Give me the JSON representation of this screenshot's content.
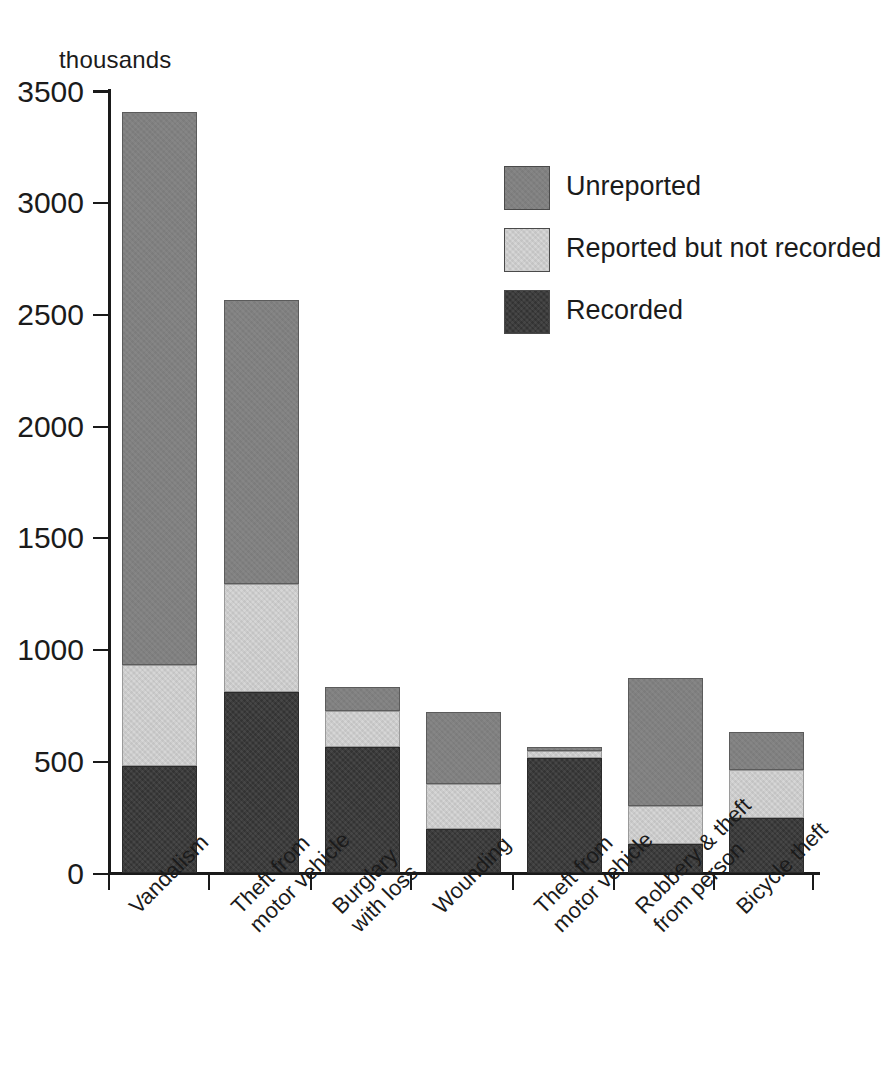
{
  "chart_data": {
    "type": "bar",
    "subtype": "stacked-bar",
    "title": "",
    "xlabel": "",
    "ylabel": "thousands",
    "unit_caption": "thousands",
    "ylim": [
      0,
      3500
    ],
    "yticks": [
      0,
      500,
      1000,
      1500,
      2000,
      2500,
      3000,
      3500
    ],
    "ytick_labels": [
      "0",
      "500",
      "1000",
      "1500",
      "2000",
      "2500",
      "3000",
      "3500"
    ],
    "grid": false,
    "legend_position": "upper right",
    "categories": [
      "Vandalism",
      "Theft from motor vehicle",
      "Burglary with loss",
      "Wounding",
      "Theft from motor vehicle",
      "Robbery & theft from person",
      "Bicycle theft"
    ],
    "category_label_lines": [
      [
        "Vandalism"
      ],
      [
        "Theft from",
        "motor vehicle"
      ],
      [
        "Burglary",
        "with loss"
      ],
      [
        "Wounding"
      ],
      [
        "Theft from",
        "motor vehicle"
      ],
      [
        "Robbery & theft",
        "from person"
      ],
      [
        "Bicycle theft"
      ]
    ],
    "series": [
      {
        "name": "Recorded",
        "color": "#333333",
        "values": [
          480,
          810,
          565,
          195,
          515,
          130,
          245
        ]
      },
      {
        "name": "Reported but not recorded",
        "color": "#d6d6d6",
        "values": [
          450,
          480,
          160,
          205,
          30,
          170,
          215
        ]
      },
      {
        "name": "Unreported",
        "color": "#808080",
        "values": [
          2470,
          1270,
          105,
          320,
          20,
          570,
          170
        ]
      }
    ],
    "stack_order_bottom_to_top": [
      "Recorded",
      "Reported but not recorded",
      "Unreported"
    ],
    "totals": [
      3400,
      2560,
      830,
      720,
      565,
      870,
      630
    ],
    "segment_tops": [
      {
        "category": "Vandalism",
        "recorded_top": 480,
        "reported_top": 930,
        "unreported_top": 3400
      },
      {
        "category": "Theft from motor vehicle",
        "recorded_top": 810,
        "reported_top": 1290,
        "unreported_top": 2560
      },
      {
        "category": "Burglary with loss",
        "recorded_top": 565,
        "reported_top": 725,
        "unreported_top": 830
      },
      {
        "category": "Wounding",
        "recorded_top": 195,
        "reported_top": 400,
        "unreported_top": 720
      },
      {
        "category": "Theft from motor vehicle",
        "recorded_top": 515,
        "reported_top": 545,
        "unreported_top": 565
      },
      {
        "category": "Robbery & theft from person",
        "recorded_top": 130,
        "reported_top": 300,
        "unreported_top": 870
      },
      {
        "category": "Bicycle theft",
        "recorded_top": 245,
        "reported_top": 460,
        "unreported_top": 630
      }
    ]
  },
  "legend": {
    "items": [
      {
        "label": "Unreported",
        "color": "#808080",
        "swatch": "unreported"
      },
      {
        "label": "Reported but not recorded",
        "color": "#d6d6d6",
        "swatch": "reported"
      },
      {
        "label": "Recorded",
        "color": "#333333",
        "swatch": "recorded"
      }
    ]
  },
  "axis": {
    "unit_caption": "thousands",
    "ytick_labels": [
      "3500",
      "3000",
      "2500",
      "2000",
      "1500",
      "1000",
      "500",
      "0"
    ]
  },
  "colors": {
    "unreported": "#808080",
    "reported_not_recorded": "#d6d6d6",
    "recorded": "#333333",
    "axis": "#1a1a1a",
    "background": "#ffffff",
    "text": "#1b1b1b"
  }
}
